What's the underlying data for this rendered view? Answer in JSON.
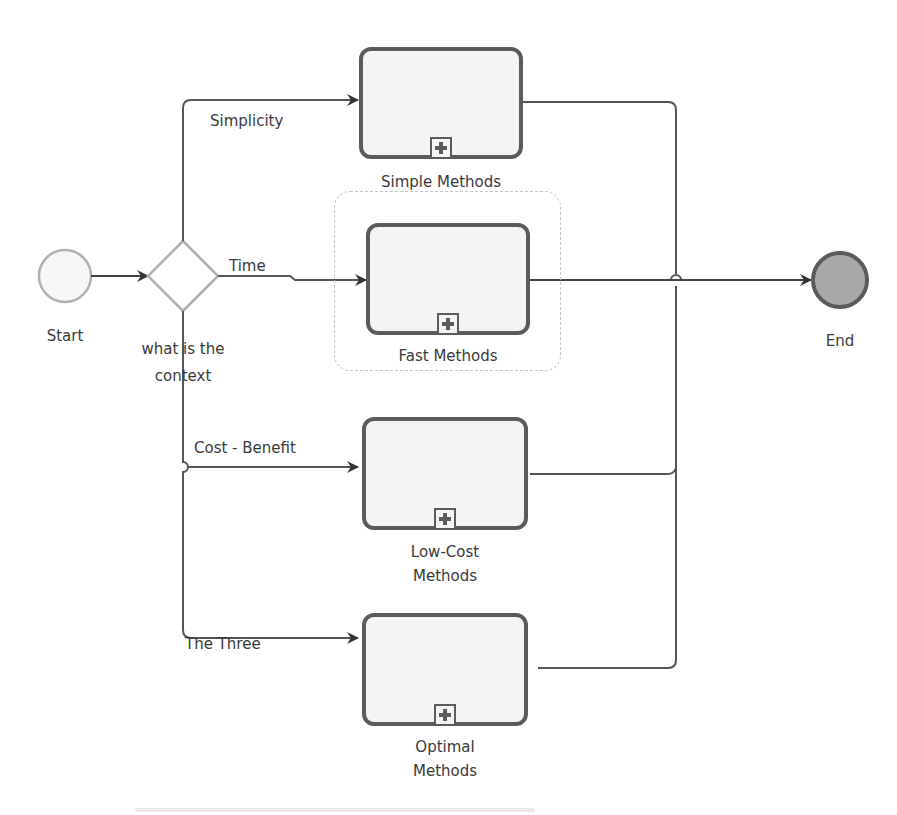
{
  "diagram": {
    "type": "BPMN process",
    "start_event": {
      "label": "Start"
    },
    "end_event": {
      "label": "End"
    },
    "gateway": {
      "label_line1": "what is the",
      "label_line2": "context"
    },
    "flows": {
      "simplicity": "Simplicity",
      "time": "Time",
      "cost_benefit": "Cost - Benefit",
      "the_three": "The Three"
    },
    "tasks": {
      "simple": {
        "label": "Simple Methods"
      },
      "fast": {
        "label": "Fast Methods"
      },
      "low_cost": {
        "label_line1": "Low-Cost",
        "label_line2": "Methods"
      },
      "optimal": {
        "label_line1": "Optimal",
        "label_line2": "Methods"
      }
    },
    "colors": {
      "stroke": "#5b5b5b",
      "task_fill": "#f4f4f4",
      "end_fill": "#a9a9a9",
      "light_stroke": "#b0b0b0",
      "group_border": "#c4c4c4"
    }
  }
}
